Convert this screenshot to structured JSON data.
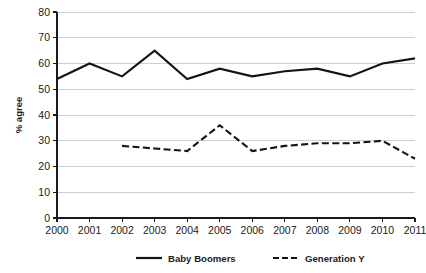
{
  "chart_data": {
    "type": "line",
    "title": "",
    "xlabel": "",
    "ylabel": "% agree",
    "categories": [
      "2000",
      "2001",
      "2002",
      "2003",
      "2004",
      "2005",
      "2006",
      "2007",
      "2008",
      "2009",
      "2010",
      "2011"
    ],
    "x": [
      2000,
      2001,
      2002,
      2003,
      2004,
      2005,
      2006,
      2007,
      2008,
      2009,
      2010,
      2011
    ],
    "xlim": [
      2000,
      2011
    ],
    "ylim": [
      0,
      80
    ],
    "yticks": [
      0,
      10,
      20,
      30,
      40,
      50,
      60,
      70,
      80
    ],
    "ytick_labels": [
      "0",
      "10",
      "20",
      "30",
      "40",
      "50",
      "60",
      "70",
      "80"
    ],
    "grid": "horizontal",
    "legend_position": "bottom",
    "series": [
      {
        "name": "Baby Boomers",
        "style": "solid",
        "color": "#141414",
        "values": [
          54,
          60,
          55,
          65,
          54,
          58,
          55,
          57,
          58,
          55,
          60,
          62
        ]
      },
      {
        "name": "Generation Y",
        "style": "dashed",
        "color": "#141414",
        "values": [
          null,
          null,
          28,
          27,
          26,
          36,
          26,
          28,
          29,
          29,
          30,
          23
        ]
      }
    ]
  },
  "axes": {
    "y_axis_title": "% agree",
    "y_tick_labels": [
      "80",
      "70",
      "60",
      "50",
      "40",
      "30",
      "20",
      "10",
      "0"
    ],
    "x_tick_labels": [
      "2000",
      "2001",
      "2002",
      "2003",
      "2004",
      "2005",
      "2006",
      "2007",
      "2008",
      "2009",
      "2010",
      "2011"
    ]
  },
  "legend": {
    "items": [
      {
        "label": "Baby Boomers",
        "style": "solid"
      },
      {
        "label": "Generation Y",
        "style": "dashed"
      }
    ]
  }
}
